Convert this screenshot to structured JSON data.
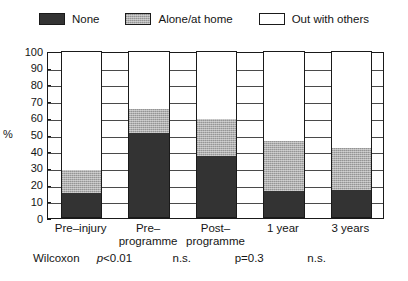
{
  "chart_data": {
    "type": "bar",
    "subtype": "stacked-bar-percent",
    "title": "",
    "xlabel": "",
    "ylabel": "%",
    "ylim": [
      0,
      100
    ],
    "yticks": [
      0,
      10,
      20,
      30,
      40,
      50,
      60,
      70,
      80,
      90,
      100
    ],
    "grid": true,
    "grid_axis": "y",
    "legend_position": "top-center",
    "categories": [
      "Pre-injury",
      "Pre-programme",
      "Post-programme",
      "1 year",
      "3 years"
    ],
    "category_lines": [
      [
        "Pre–injury",
        ""
      ],
      [
        "Pre–",
        "programme"
      ],
      [
        "Post–",
        "programme"
      ],
      [
        "1 year",
        ""
      ],
      [
        "3 years",
        ""
      ]
    ],
    "series": [
      {
        "name": "None",
        "color": "#333333",
        "values": [
          15,
          51,
          37,
          16,
          17
        ]
      },
      {
        "name": "Alone/at home",
        "color": "#aeaeae",
        "values": [
          14,
          14,
          22,
          30,
          25
        ]
      },
      {
        "name": "Out with others",
        "color": "#ffffff",
        "values": [
          71,
          35,
          41,
          54,
          58
        ]
      }
    ],
    "cumulative_tops": [
      {
        "none": 15,
        "alone": 29
      },
      {
        "none": 51,
        "alone": 65
      },
      {
        "none": 37,
        "alone": 59
      },
      {
        "none": 16,
        "alone": 46
      },
      {
        "none": 17,
        "alone": 42
      }
    ]
  },
  "legend": {
    "entries": [
      {
        "label": "None",
        "swatch": "dark-fill-swatch"
      },
      {
        "label": "Alone/at home",
        "swatch": "gray-hatch-swatch"
      },
      {
        "label": "Out with others",
        "swatch": "white-fill-swatch"
      }
    ]
  },
  "axis": {
    "y_title": "%",
    "ticks": [
      "100",
      "90",
      "80",
      "70",
      "60",
      "50",
      "40",
      "30",
      "20",
      "10",
      "0"
    ]
  },
  "stats": {
    "test_name": "Wilcoxon",
    "values": [
      "p<0.01",
      "n.s.",
      "p=0.3",
      "n.s."
    ],
    "value_parts": [
      {
        "italic": "p",
        "rest": "<0.01"
      },
      {
        "italic": "",
        "rest": "n.s."
      },
      {
        "italic": "",
        "rest": "p=0.3"
      },
      {
        "italic": "",
        "rest": "n.s."
      }
    ]
  }
}
